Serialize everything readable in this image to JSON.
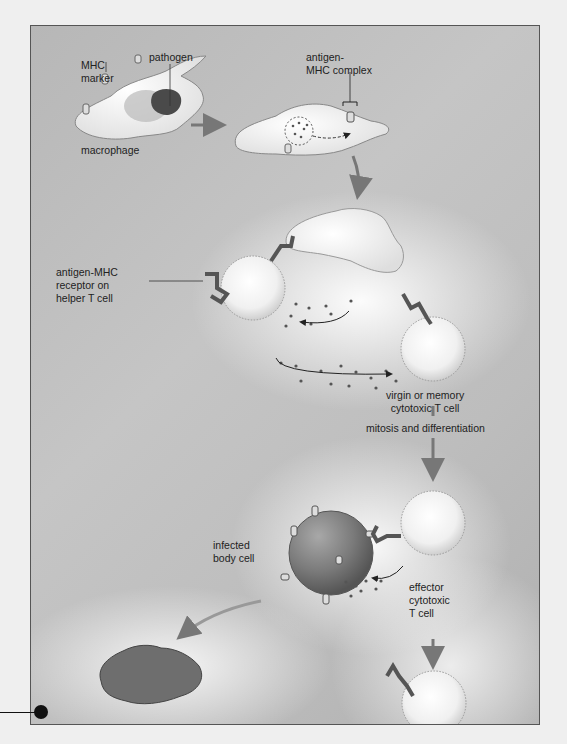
{
  "diagram": {
    "type": "cell-mediated immune response illustration",
    "labels": {
      "mhc_marker": [
        "MHC",
        "marker"
      ],
      "pathogen": "pathogen",
      "macrophage": "macrophage",
      "antigen_mhc_complex": [
        "antigen-",
        "MHC complex"
      ],
      "antigen_mhc_receptor": [
        "antigen-MHC",
        "receptor on",
        "helper T cell"
      ],
      "virgin_memory": [
        "virgin or memory",
        "cytotoxic T cell"
      ],
      "mitosis": "mitosis and differentiation",
      "infected_body_cell": [
        "infected",
        "body cell"
      ],
      "effector": [
        "effector",
        "cytotoxic",
        "T cell"
      ]
    },
    "colors": {
      "background_gray": "#bdbdbd",
      "frame_border": "#555555",
      "cell_white": "#f4f4f4",
      "infected_cell": "#7a7a7a",
      "dead_cell": "#6a6a6a",
      "arrow_gray": "#8a8a8a",
      "pointer_black": "#111111"
    }
  }
}
